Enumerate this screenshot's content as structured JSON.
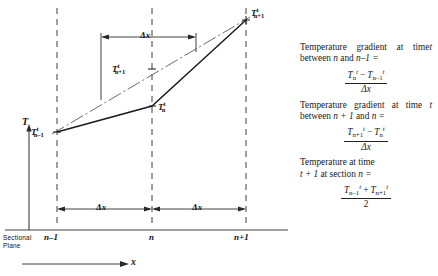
{
  "figure": {
    "axis_y_label": "T",
    "axis_x_label": "x",
    "sectional_plane_line1": "Sectional",
    "sectional_plane_line2": "Plane",
    "ticks": [
      {
        "name": "tick-n-minus-1",
        "text": "n–1"
      },
      {
        "name": "tick-n",
        "text": "n"
      },
      {
        "name": "tick-n-plus-1",
        "text": "n+1"
      }
    ],
    "dimension_labels": [
      {
        "name": "delta-x-top",
        "text": "Δx"
      },
      {
        "name": "delta-x-left",
        "text": "Δx"
      },
      {
        "name": "delta-x-right",
        "text": "Δx"
      }
    ],
    "point_labels": [
      {
        "name": "point-label-T-n-minus-1-t",
        "base": "T",
        "sub": "n–1",
        "sup": "t"
      },
      {
        "name": "point-label-T-n-t",
        "base": "T",
        "sub": "n",
        "sup": "t"
      },
      {
        "name": "point-label-T-n-plus-1-t-mid",
        "base": "T",
        "sub": "n+1",
        "sup": "t"
      },
      {
        "name": "point-label-T-n-plus-1-t",
        "base": "T",
        "sub": "n+1",
        "sup": "t"
      }
    ]
  },
  "panel": {
    "items": [
      {
        "name": "gradient-n-to-n-minus-1",
        "text": "Temperature gradient at time t between n and n–1 =",
        "numerator": "Tₙᵗ − Tₙ₋₁ᵗ",
        "denominator": "Δx"
      },
      {
        "name": "gradient-n-plus-1-to-n",
        "text": "Temperature gradient at time t between n + 1 and n =",
        "numerator": "Tₙ₊₁ᵗ − Tₙᵗ",
        "denominator": "Δx"
      },
      {
        "name": "temperature-at-time-t-plus-1",
        "text": "Temperature at time t + 1 at section n =",
        "numerator": "Tₙ₋₁ᵗ + Tₙ₊₁ᵗ",
        "denominator": "2"
      }
    ],
    "strings": {
      "p1_a": "Temperature",
      "p1_b": "gradient",
      "p1_c": "at",
      "p1_d": "time",
      "p1_e": "t",
      "p1_f": "between",
      "p1_g": "n",
      "p1_h": "and",
      "p1_i": "n–1 =",
      "p2_a": "Temperature",
      "p2_b": "gradient",
      "p2_c": "at",
      "p2_d": "time",
      "p2_e": "t",
      "p2_f": "between",
      "p2_g": "n + 1",
      "p2_h": "and",
      "p2_i": "n =",
      "p3_a": "Temperature at time",
      "p3_b": "t + 1",
      "p3_c": "at section",
      "p3_d": "n =",
      "T": "T",
      "minus": "−",
      "plus": "+",
      "dx": "Δx",
      "two": "2",
      "sub_n": "n",
      "sub_nm1": "n–1",
      "sub_np1": "n+1",
      "sup_t": "t"
    }
  },
  "colors": {
    "ink": "#1a1a1a",
    "dashed": "#4a4a4a",
    "background": "#ffffff"
  }
}
